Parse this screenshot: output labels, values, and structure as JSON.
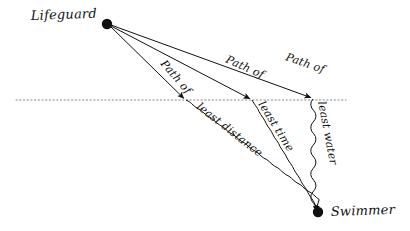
{
  "figure": {
    "background_color": "#ffffff",
    "ink_color": "#111111",
    "shoreline_color": "#8a8a8a"
  },
  "endpoints": [
    {
      "id": "lifeguard",
      "label": "Lifeguard",
      "marker": "filled-dot",
      "x": 107,
      "y": 24,
      "label_x": 31,
      "label_y": 20,
      "label_side": "left",
      "region": "land"
    },
    {
      "id": "swimmer",
      "label": "Swimmer",
      "marker": "filled-dot",
      "x": 318,
      "y": 212,
      "label_x": 331,
      "label_y": 216,
      "label_side": "right",
      "region": "water"
    }
  ],
  "shoreline": {
    "name": "water-line",
    "style": "dotted",
    "x1": 16,
    "x2": 346,
    "y": 100
  },
  "paths": [
    {
      "id": "least-distance",
      "label_top": "Path of",
      "label_bottom": "least distance",
      "entry_x": 186,
      "entry_y": 100,
      "land_angle_deg": 49,
      "water_angle_deg": 38,
      "label_top_x": 160,
      "label_top_y": 64,
      "label_bottom_x": 196,
      "label_bottom_y": 108,
      "arrow_at_shore": true,
      "arrow_at_swimmer": true
    },
    {
      "id": "least-time",
      "label_top": "Path of",
      "label_bottom": "least time",
      "entry_x": 252,
      "entry_y": 100,
      "land_angle_deg": 24,
      "water_angle_deg": 58,
      "label_top_x": 225,
      "label_top_y": 62,
      "label_bottom_x": 258,
      "label_bottom_y": 104,
      "arrow_at_shore": true,
      "arrow_at_swimmer": true
    },
    {
      "id": "least-water",
      "label_top": "Path of",
      "label_bottom": "least water",
      "entry_x": 313,
      "entry_y": 99,
      "land_angle_deg": 19,
      "water_angle_deg": 79,
      "label_top_x": 285,
      "label_top_y": 60,
      "label_bottom_x": 318,
      "label_bottom_y": 102,
      "arrow_at_shore": true,
      "arrow_at_swimmer": true
    }
  ]
}
